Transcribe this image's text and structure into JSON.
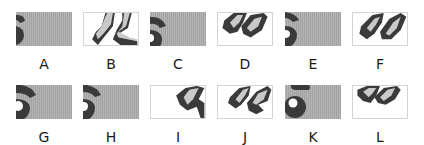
{
  "figure": {
    "colors": {
      "gray_background": "#ababab",
      "dark_shape": "#3a3a3a",
      "light_shape": "#c9c9c9",
      "white_background": "#ffffff",
      "border": "#d4d4d4"
    },
    "panels": [
      {
        "label": "A",
        "background": "gray",
        "content": "partial dark arc on left edge"
      },
      {
        "label": "B",
        "background": "white",
        "content": "two chevron shapes, lower"
      },
      {
        "label": "C",
        "background": "gray",
        "content": "dark arc with small white notch on left"
      },
      {
        "label": "D",
        "background": "white",
        "content": "two chevron shapes"
      },
      {
        "label": "E",
        "background": "gray",
        "content": "dark arc with white notch on left"
      },
      {
        "label": "F",
        "background": "white",
        "content": "two chevron shapes, centered"
      },
      {
        "label": "G",
        "background": "gray",
        "content": "dark arc with white circle on left"
      },
      {
        "label": "H",
        "background": "gray",
        "content": "dark arc with white notch on left"
      },
      {
        "label": "I",
        "background": "white",
        "content": "single chevron shape on right"
      },
      {
        "label": "J",
        "background": "white",
        "content": "two chevron shapes, lower right"
      },
      {
        "label": "K",
        "background": "gray",
        "content": "dark ring with white center and arc above"
      },
      {
        "label": "L",
        "background": "white",
        "content": "two chevron shapes, upper"
      }
    ]
  }
}
